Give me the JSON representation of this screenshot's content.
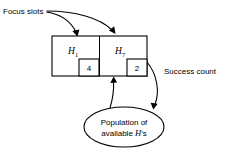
{
  "figure": {
    "background_color": "#ffffff",
    "stroke_color": "#000000",
    "annotations": {
      "focus_slots_label": "Focus slots",
      "success_count_label": "Success count"
    },
    "slots": [
      {
        "name": "H",
        "subscript": "1",
        "count": "4"
      },
      {
        "name": "H",
        "subscript": "7",
        "count": "2"
      }
    ],
    "population": {
      "line1": "Population of",
      "line2_prefix": "available ",
      "line2_italic": "H",
      "line2_suffix": "'s"
    }
  }
}
